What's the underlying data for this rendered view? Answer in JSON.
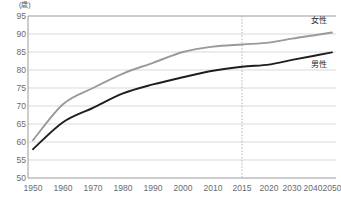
{
  "chart_data": {
    "type": "line",
    "title": "",
    "subtitle": "",
    "xlabel": "",
    "ylabel": "",
    "unit_label": "(歳)",
    "grid": true,
    "legend_position": "right-inline",
    "ylim": [
      50,
      95
    ],
    "yticks": [
      50,
      55,
      60,
      65,
      70,
      75,
      80,
      85,
      90,
      95
    ],
    "xticks": [
      "1950",
      "1960",
      "1970",
      "1980",
      "1990",
      "2000",
      "2010",
      "2015",
      "2020",
      "2030",
      "2040",
      "2050"
    ],
    "x": [
      1950,
      1960,
      1970,
      1980,
      1990,
      2000,
      2010,
      2015,
      2020,
      2030,
      2040,
      2050
    ],
    "projection_divider_x": "2015",
    "series": [
      {
        "name": "女性",
        "color": "#9a9a9c",
        "values": [
          60.5,
          70.5,
          75.0,
          79.0,
          82.0,
          85.0,
          86.5,
          87.1,
          87.6,
          88.7,
          89.6,
          90.4
        ]
      },
      {
        "name": "男性",
        "color": "#1e1e20",
        "values": [
          58.0,
          65.5,
          69.5,
          73.5,
          76.0,
          78.0,
          79.8,
          80.9,
          81.5,
          82.8,
          83.9,
          84.9
        ]
      }
    ]
  },
  "axes": {
    "unit": "(歳)",
    "y_ticks": [
      "95",
      "90",
      "85",
      "80",
      "75",
      "70",
      "65",
      "60",
      "55",
      "50"
    ],
    "x_ticks": [
      "1950",
      "1960",
      "1970",
      "1980",
      "1990",
      "2000",
      "2010",
      "2015",
      "2020",
      "2030",
      "2040",
      "2050"
    ]
  },
  "legend": {
    "female_label": "女性",
    "male_label": "男性",
    "female_color": "#9a9a9c",
    "male_color": "#1e1e20"
  },
  "style": {
    "grid_color": "#d9d9db",
    "axis_color": "#9a9a9c",
    "divider_color": "#b8b8ba",
    "background": "#ffffff"
  }
}
